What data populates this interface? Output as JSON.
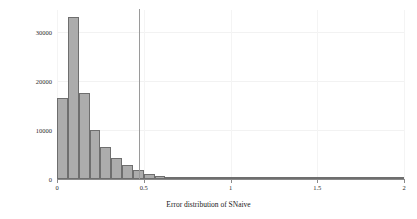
{
  "chart_data": {
    "type": "bar",
    "title": "",
    "subtitle": "",
    "xlabel": "Error distribution of SNaive",
    "ylabel": "Count",
    "xlim": [
      0,
      2
    ],
    "ylim": [
      0,
      34500
    ],
    "xticks": [
      0,
      0.5,
      1,
      1.5,
      2
    ],
    "xticklabels": [
      "0",
      "0.5",
      "1",
      "1.5",
      "2"
    ],
    "yticks": [
      0,
      10000,
      20000,
      30000
    ],
    "yticklabels": [
      "0",
      "10000",
      "20000",
      "30000"
    ],
    "grid": "faint",
    "legend": "none",
    "bin_width": 0.0625,
    "bin_left_edges": [
      0.0,
      0.0625,
      0.125,
      0.1875,
      0.25,
      0.3125,
      0.375,
      0.4375,
      0.5,
      0.5625,
      0.625,
      0.6875,
      0.75,
      0.8125,
      0.875,
      0.9375,
      1.0,
      1.0625,
      1.125,
      1.1875,
      1.25,
      1.3125,
      1.375,
      1.4375,
      1.5,
      1.5625,
      1.625,
      1.6875,
      1.75,
      1.8125,
      1.875,
      1.9375
    ],
    "values": [
      16500,
      33000,
      17500,
      10000,
      6500,
      4200,
      2800,
      1800,
      1100,
      700,
      450,
      300,
      200,
      150,
      110,
      90,
      70,
      55,
      45,
      35,
      28,
      22,
      18,
      14,
      11,
      9,
      7,
      6,
      5,
      4,
      3,
      2
    ],
    "categories": [
      "0.00",
      "0.06",
      "0.13",
      "0.19",
      "0.25",
      "0.31",
      "0.38",
      "0.44",
      "0.50",
      "0.56",
      "0.63",
      "0.69",
      "0.75",
      "0.81",
      "0.88",
      "0.94",
      "1.00",
      "1.06",
      "1.13",
      "1.19",
      "1.25",
      "1.31",
      "1.38",
      "1.44",
      "1.50",
      "1.56",
      "1.63",
      "1.69",
      "1.75",
      "1.81",
      "1.88",
      "1.94"
    ],
    "annotations": [
      {
        "name": "mean-reference-line",
        "type": "vline",
        "x": 0.47
      }
    ],
    "colors": {
      "bar_fill": "#acacac",
      "bar_edge": "#6e6e6e",
      "axis": "#8a8a8a",
      "grid": "#f2f2f2",
      "vline": "#9a9a9a",
      "text": "#1a1a1a",
      "background": "#ffffff"
    }
  }
}
